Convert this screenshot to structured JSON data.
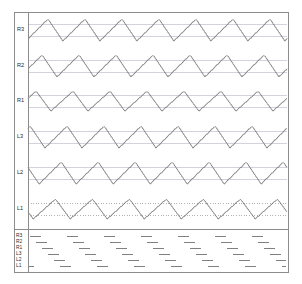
{
  "figure": {
    "background": "#ffffff",
    "border_color": "#808080",
    "frame": {
      "x": 14,
      "y": 12,
      "width": 274,
      "height": 260
    },
    "axis_line_x": 28,
    "panel_divider_y": 229
  },
  "style": {
    "trace_color": "#6b6b6b",
    "gridline_color": "#c8c8d2",
    "dotted_gridline_color": "#a0a0a0",
    "event_bar_color": "#808080",
    "label_color": "#2b2b2b",
    "frame_color": "#8c8c8c"
  },
  "top_panel": {
    "label": "waveform-traces",
    "channel_labels": [
      "R3",
      "R2",
      "R1",
      "L3",
      "L2",
      "L1"
    ]
  },
  "bottom_panel": {
    "label": "event-bars",
    "channel_labels": [
      "R3",
      "R2",
      "R1",
      "L3",
      "L2",
      "L1"
    ]
  },
  "chart_data": {
    "type": "line",
    "title": "",
    "subtitle": "",
    "xlabel": "",
    "ylabel": "",
    "grid": true,
    "legend_position": "left-axis-labels",
    "x_range": [
      0,
      274
    ],
    "n_cycles": 7,
    "plot_area": {
      "x0": 28,
      "x1": 287,
      "y0": 13,
      "y1": 228
    },
    "panels": [
      {
        "name": "traces",
        "y0": 13,
        "y1": 228,
        "band_height": 35.8,
        "series": [
          {
            "name": "R3",
            "row": 0,
            "baseline_y": 30,
            "amplitude": 11,
            "phase": 0.06,
            "cycles": 7,
            "waveform": "sawtooth-triangular",
            "gridlines": [
              24,
              36
            ],
            "gridline_style": "solid"
          },
          {
            "name": "R2",
            "row": 1,
            "baseline_y": 66,
            "amplitude": 11,
            "phase": 0.22,
            "cycles": 7,
            "waveform": "sawtooth-triangular",
            "gridlines": [
              60,
              72
            ],
            "gridline_style": "solid"
          },
          {
            "name": "R1",
            "row": 2,
            "baseline_y": 101,
            "amplitude": 10,
            "phase": 0.38,
            "cycles": 7,
            "waveform": "sawtooth-triangular",
            "gridlines": [
              95,
              107
            ],
            "gridline_style": "solid"
          },
          {
            "name": "L3",
            "row": 3,
            "baseline_y": 137,
            "amplitude": 11,
            "phase": 0.54,
            "cycles": 7,
            "waveform": "sawtooth-triangular",
            "gridlines": [
              131,
              143
            ],
            "gridline_style": "solid"
          },
          {
            "name": "L2",
            "row": 4,
            "baseline_y": 173,
            "amplitude": 11,
            "phase": 0.7,
            "cycles": 7,
            "waveform": "sawtooth-triangular",
            "gridlines": [
              167,
              179
            ],
            "gridline_style": "solid"
          },
          {
            "name": "L1",
            "row": 5,
            "baseline_y": 209,
            "amplitude": 10,
            "phase": 0.86,
            "cycles": 7,
            "waveform": "sawtooth-triangular",
            "gridlines": [
              203,
              215
            ],
            "gridline_style": "dotted"
          }
        ]
      },
      {
        "name": "events",
        "y0": 229,
        "y1": 272,
        "row_spacing": 6.2,
        "series": [
          {
            "name": "R3",
            "row": 0,
            "y": 236,
            "phase": 0.06,
            "cycles": 7,
            "duty": 0.3
          },
          {
            "name": "R2",
            "row": 1,
            "y": 242,
            "phase": 0.22,
            "cycles": 7,
            "duty": 0.3
          },
          {
            "name": "R1",
            "row": 2,
            "y": 248,
            "phase": 0.38,
            "cycles": 7,
            "duty": 0.3
          },
          {
            "name": "L3",
            "row": 3,
            "y": 254,
            "phase": 0.54,
            "cycles": 7,
            "duty": 0.3
          },
          {
            "name": "L2",
            "row": 4,
            "y": 260,
            "phase": 0.7,
            "cycles": 7,
            "duty": 0.3
          },
          {
            "name": "L1",
            "row": 5,
            "y": 266,
            "phase": 0.86,
            "cycles": 7,
            "duty": 0.3
          }
        ]
      }
    ]
  }
}
